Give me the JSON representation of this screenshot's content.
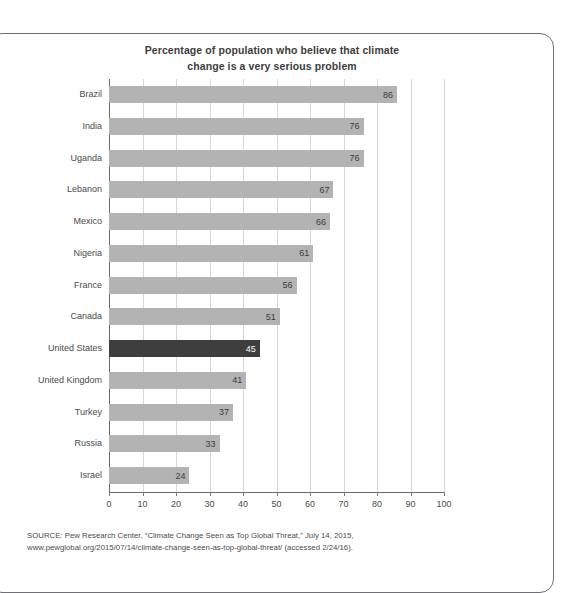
{
  "chart_data": {
    "type": "bar",
    "orientation": "horizontal",
    "title": "Percentage of population who believe that climate change is a very serious problem",
    "title_line1": "Percentage of population who believe that climate",
    "title_line2": "change is a very serious problem",
    "xlabel": "",
    "ylabel": "",
    "xlim": [
      0,
      100
    ],
    "xticks": [
      0,
      10,
      20,
      30,
      40,
      50,
      60,
      70,
      80,
      90,
      100
    ],
    "grid": "vertical",
    "legend": "none",
    "categories": [
      "Brazil",
      "India",
      "Uganda",
      "Lebanon",
      "Mexico",
      "Nigeria",
      "France",
      "Canada",
      "United States",
      "United Kingdom",
      "Turkey",
      "Russia",
      "Israel"
    ],
    "values": [
      86,
      76,
      76,
      67,
      66,
      61,
      56,
      51,
      45,
      41,
      37,
      33,
      24
    ],
    "highlight_category": "United States",
    "colors": {
      "bar": "#b3b3b3",
      "bar_highlight": "#3e3e3e",
      "value_label": "#3c3c3c",
      "value_label_highlight": "#ffffff",
      "gridline": "#d8d8d8",
      "axis": "#6a6a6a",
      "text": "#4a4a4a",
      "card_border": "#6f6f73",
      "background": "#ffffff"
    }
  },
  "source": {
    "line1": "SOURCE: Pew Research Center, “Climate Change Seen as Top Global Threat,” July 14, 2015,",
    "line2": "www.pewglobal.org/2015/07/14/climate-change-seen-as-top-global-threat/ (accessed 2/24/16)."
  }
}
